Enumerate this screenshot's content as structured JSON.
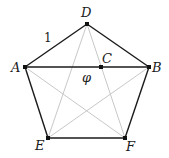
{
  "diagram": {
    "colors": {
      "edge": "#1a1a1a",
      "diagonal": "#c8c8c8",
      "point": "#111111",
      "background": "#ffffff"
    },
    "points": {
      "A": {
        "x": 25,
        "y": 67,
        "label": "A",
        "lx": 11,
        "ly": 72
      },
      "B": {
        "x": 149,
        "y": 67,
        "label": "B",
        "lx": 152,
        "ly": 72
      },
      "C": {
        "x": 101,
        "y": 67,
        "label": "C",
        "lx": 102,
        "ly": 62
      },
      "D": {
        "x": 87,
        "y": 24,
        "label": "D",
        "lx": 82,
        "ly": 16
      },
      "E": {
        "x": 48,
        "y": 138,
        "label": "E",
        "lx": 36,
        "ly": 150
      },
      "F": {
        "x": 125,
        "y": 138,
        "label": "F",
        "lx": 126,
        "ly": 151
      }
    },
    "annotations": {
      "side_length": "1",
      "diagonal_length": "φ"
    },
    "edges": [
      [
        "D",
        "B"
      ],
      [
        "B",
        "F"
      ],
      [
        "F",
        "E"
      ],
      [
        "E",
        "A"
      ],
      [
        "A",
        "D"
      ],
      [
        "A",
        "B"
      ]
    ],
    "diagonals": [
      [
        "D",
        "E"
      ],
      [
        "D",
        "F"
      ],
      [
        "A",
        "F"
      ],
      [
        "B",
        "E"
      ]
    ]
  }
}
